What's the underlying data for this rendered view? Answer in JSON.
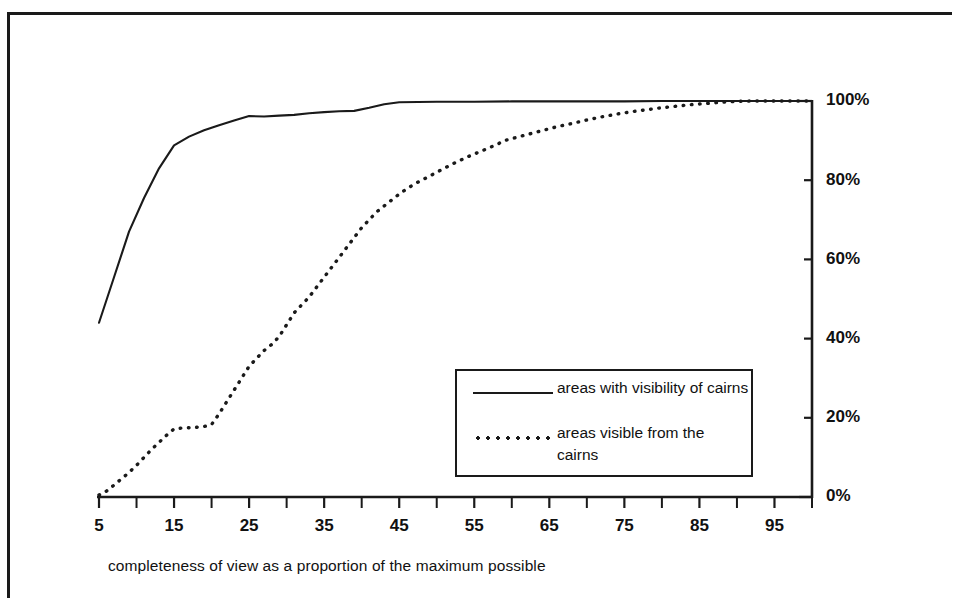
{
  "chart_data": {
    "type": "line",
    "title": "",
    "subtitle": "",
    "xlabel": "completeness of view as a proportion of the maximum possible",
    "ylabel": "",
    "xlim": [
      5,
      100
    ],
    "ylim": [
      0,
      100
    ],
    "grid": false,
    "legend_position": "inside-lower-right",
    "x_tick_labels": [
      "5",
      "15",
      "25",
      "35",
      "45",
      "55",
      "65",
      "75",
      "85",
      "95"
    ],
    "x_tick_values": [
      5,
      15,
      25,
      35,
      45,
      55,
      65,
      75,
      85,
      95
    ],
    "x_minor_tick_values": [
      10,
      20,
      30,
      40,
      50,
      60,
      70,
      80,
      90,
      100
    ],
    "y_tick_labels": [
      "0%",
      "20%",
      "40%",
      "60%",
      "80%",
      "100%"
    ],
    "y_tick_values": [
      0,
      20,
      40,
      60,
      80,
      100
    ],
    "y_axis_side": "right",
    "line_color": "#1a1a1a",
    "background_color": "#ffffff",
    "series": [
      {
        "name": "areas with visibility of cairns",
        "style": "solid",
        "x": [
          5,
          7,
          9,
          11,
          13,
          15,
          17,
          19,
          21,
          23,
          25,
          27,
          29,
          31,
          33,
          35,
          37,
          39,
          41,
          43,
          45,
          50,
          55,
          60,
          65,
          70,
          75,
          80,
          85,
          90,
          95,
          100
        ],
        "values": [
          44.0,
          55.5,
          67.0,
          75.5,
          83.0,
          88.8,
          91.0,
          92.6,
          93.9,
          95.1,
          96.2,
          96.1,
          96.3,
          96.5,
          96.9,
          97.2,
          97.4,
          97.5,
          98.3,
          99.2,
          99.7,
          99.8,
          99.8,
          99.9,
          99.9,
          99.9,
          99.9,
          100.0,
          100.0,
          100.0,
          100.0,
          100.0
        ]
      },
      {
        "name": "areas visible from the cairns",
        "style": "dotted",
        "x": [
          5,
          6,
          7,
          8,
          9,
          10,
          11,
          12,
          13,
          14,
          15,
          16,
          17,
          18,
          19,
          20,
          21,
          22,
          23,
          24,
          25,
          26,
          27,
          28,
          29,
          30,
          31,
          32,
          33,
          34,
          35,
          36,
          37,
          38,
          39,
          40,
          41,
          42,
          43,
          44,
          45,
          46,
          47,
          48,
          49,
          50,
          52,
          54,
          56,
          58,
          59,
          60,
          62,
          64,
          66,
          68,
          70,
          72,
          74,
          76,
          78,
          80,
          82,
          84,
          86,
          88,
          90,
          92,
          95,
          100
        ],
        "values": [
          0.5,
          1.5,
          3.0,
          4.6,
          6.2,
          8.0,
          10.0,
          12.0,
          13.8,
          15.6,
          17.2,
          17.4,
          17.5,
          17.6,
          17.8,
          18.3,
          21.0,
          24.0,
          27.0,
          30.0,
          33.0,
          35.0,
          37.0,
          38.5,
          40.5,
          43.5,
          46.5,
          48.5,
          50.5,
          53.0,
          55.5,
          58.0,
          60.5,
          63.0,
          65.5,
          68.0,
          70.0,
          72.0,
          73.5,
          75.0,
          76.5,
          77.8,
          79.0,
          80.0,
          81.0,
          82.0,
          84.0,
          85.8,
          87.4,
          89.0,
          90.0,
          90.5,
          91.5,
          92.5,
          93.5,
          94.3,
          95.2,
          96.0,
          96.7,
          97.3,
          97.8,
          98.3,
          98.7,
          99.1,
          99.4,
          99.7,
          99.9,
          100.0,
          100.0,
          100.0
        ]
      }
    ]
  },
  "legend": {
    "entries": [
      {
        "label": "areas with visibility of cairns",
        "style": "solid"
      },
      {
        "label": "areas visible from the cairns",
        "style": "dotted"
      }
    ]
  },
  "caption": {
    "x_axis": "completeness of view as a proportion of the maximum possible"
  }
}
